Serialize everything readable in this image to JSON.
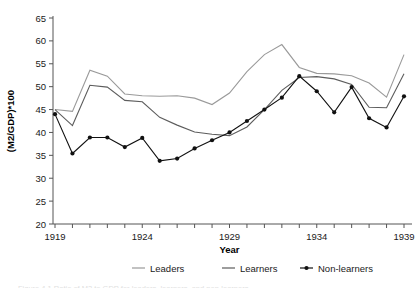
{
  "figure": {
    "caption": "Figure 4.1 Ratio of M2 to GDP for leaders, learners, and non-learners",
    "caption_visible": false
  },
  "chart_data": {
    "type": "line",
    "title": "",
    "xlabel": "Year",
    "ylabel": "(M2/GDP)*100",
    "xlim": [
      1919,
      1939
    ],
    "ylim": [
      20,
      65
    ],
    "ytick_interval": 5,
    "xtick_interval": 1,
    "grid": false,
    "legend_position": "bottom",
    "x": [
      1919,
      1920,
      1921,
      1922,
      1923,
      1924,
      1925,
      1926,
      1927,
      1928,
      1929,
      1930,
      1931,
      1932,
      1933,
      1934,
      1935,
      1936,
      1937,
      1938,
      1939
    ],
    "x_tick_labels": [
      "1919",
      "",
      "",
      "",
      "",
      "1924",
      "",
      "",
      "",
      "",
      "1929",
      "",
      "",
      "",
      "",
      "1934",
      "",
      "",
      "",
      "",
      "1939"
    ],
    "y_tick_labels": [
      "20",
      "25",
      "30",
      "35",
      "40",
      "45",
      "50",
      "55",
      "60",
      "65"
    ],
    "series": [
      {
        "name": "Leaders",
        "color": "#9a9a9a",
        "marker": "none",
        "values": [
          45.0,
          44.6,
          53.6,
          52.3,
          48.4,
          48.0,
          47.9,
          48.0,
          47.5,
          46.1,
          48.6,
          53.3,
          57.0,
          59.2,
          54.2,
          52.9,
          52.8,
          52.4,
          50.8,
          47.7,
          57.0
        ]
      },
      {
        "name": "Learners",
        "color": "#5d5d5d",
        "marker": "none",
        "values": [
          45.0,
          41.5,
          50.3,
          49.9,
          47.0,
          46.7,
          43.3,
          41.6,
          40.1,
          39.6,
          39.3,
          41.2,
          45.0,
          49.2,
          52.0,
          52.2,
          51.7,
          50.5,
          45.5,
          45.4,
          52.8
        ]
      },
      {
        "name": "Non-learners",
        "color": "#111111",
        "marker": "circle",
        "values": [
          44.0,
          35.4,
          38.9,
          38.9,
          36.8,
          38.8,
          33.8,
          34.3,
          36.5,
          38.3,
          40.0,
          42.5,
          45.0,
          47.6,
          52.3,
          49.0,
          44.4,
          49.9,
          43.1,
          41.1,
          47.9
        ]
      }
    ]
  },
  "legend": {
    "items": [
      {
        "label": "Leaders",
        "color": "#9a9a9a",
        "marker": "line"
      },
      {
        "label": "Learners",
        "color": "#5d5d5d",
        "marker": "line"
      },
      {
        "label": "Non-learners",
        "color": "#111111",
        "marker": "line-dot"
      }
    ]
  }
}
